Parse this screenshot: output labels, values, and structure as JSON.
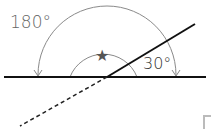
{
  "diagram": {
    "labels": {
      "outer_angle": "180°",
      "inner_angle": "30°",
      "unknown_angle_marker": "★"
    },
    "elements": {
      "horizontal_line": {
        "x1": 4,
        "y1": 77,
        "x2": 206,
        "y2": 77
      },
      "solid_ray": {
        "x1": 107,
        "y1": 77,
        "x2": 195,
        "y2": 24
      },
      "dashed_extension": {
        "x1": 107,
        "y1": 77,
        "x2": 20,
        "y2": 126
      },
      "outer_arc_radius": 70,
      "inner_arc_radius": 35
    },
    "icons": [
      "star-icon",
      "arrowhead-icon"
    ],
    "colors": {
      "line": "#111111",
      "arc": "#888888",
      "text": "#555555"
    }
  }
}
